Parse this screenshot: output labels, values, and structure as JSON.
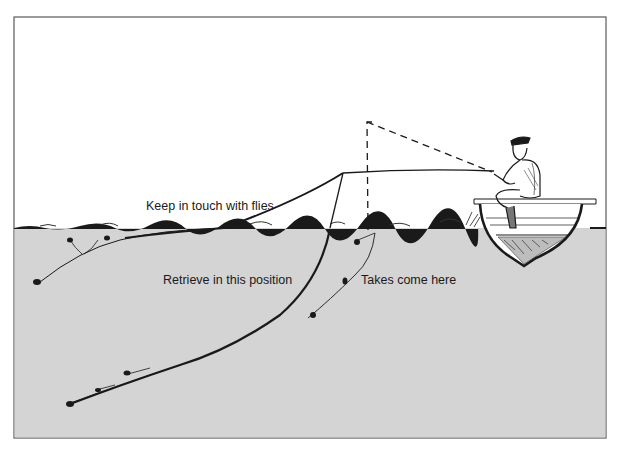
{
  "diagram": {
    "colors": {
      "background": "#ffffff",
      "frame": "#5a5a5a",
      "water": "#d4d4d4",
      "ink": "#1a1a1a"
    },
    "labels": {
      "keep_in_touch": "Keep in touch with flies",
      "retrieve_position": "Retrieve in this position",
      "takes_come_here": "Takes come here"
    },
    "elements": [
      "fisherman-seated-in-boat",
      "fly-rod-retrieve-position",
      "fly-rod-raised-dashed",
      "fly-line-with-flies-near-surface",
      "fly-line-with-flies-deep",
      "fly-line-with-flies-takes",
      "water-surface"
    ]
  }
}
